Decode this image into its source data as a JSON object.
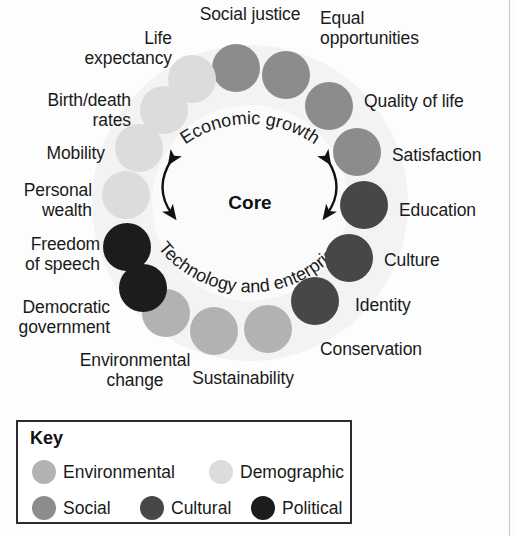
{
  "diagram": {
    "center_label": "Core",
    "arc_top": "Economic growth",
    "arc_bottom": "Technology and enterprise",
    "colors": {
      "Environmental": "#b2b2b2",
      "Demographic": "#dcdcdc",
      "Social": "#8c8c8c",
      "Cultural": "#474747",
      "Political": "#1c1c1c"
    },
    "nodes": [
      {
        "label": "Social justice",
        "category": "Social",
        "color": "#8c8c8c",
        "cx": 236,
        "cy": 68,
        "lx": 250,
        "ly": 14,
        "align": "c"
      },
      {
        "label": "Equal\nopportunities",
        "category": "Social",
        "color": "#8c8c8c",
        "cx": 286,
        "cy": 75,
        "lx": 320,
        "ly": 28,
        "align": "l"
      },
      {
        "label": "Quality of life",
        "category": "Social",
        "color": "#8c8c8c",
        "cx": 329,
        "cy": 106,
        "lx": 364,
        "ly": 101,
        "align": "l"
      },
      {
        "label": "Satisfaction",
        "category": "Social",
        "color": "#8c8c8c",
        "cx": 357,
        "cy": 152,
        "lx": 392,
        "ly": 155,
        "align": "l"
      },
      {
        "label": "Education",
        "category": "Cultural",
        "color": "#474747",
        "cx": 364,
        "cy": 205,
        "lx": 399,
        "ly": 210,
        "align": "l"
      },
      {
        "label": "Culture",
        "category": "Cultural",
        "color": "#474747",
        "cx": 349,
        "cy": 258,
        "lx": 384,
        "ly": 260,
        "align": "l"
      },
      {
        "label": "Identity",
        "category": "Cultural",
        "color": "#474747",
        "cx": 315,
        "cy": 301,
        "lx": 355,
        "ly": 305,
        "align": "l"
      },
      {
        "label": "Conservation",
        "category": "Environmental",
        "color": "#b2b2b2",
        "cx": 268,
        "cy": 329,
        "lx": 320,
        "ly": 349,
        "align": "l"
      },
      {
        "label": "Sustainability",
        "category": "Environmental",
        "color": "#b2b2b2",
        "cx": 214,
        "cy": 331,
        "lx": 243,
        "ly": 378,
        "align": "c"
      },
      {
        "label": "Environmental\nchange",
        "category": "Environmental",
        "color": "#b2b2b2",
        "cx": 166,
        "cy": 313,
        "lx": 135,
        "ly": 370,
        "align": "c"
      },
      {
        "label": "Democratic\ngovernment",
        "category": "Political",
        "color": "#1c1c1c",
        "cx": 143,
        "cy": 288,
        "lx": 110,
        "ly": 317,
        "align": "r"
      },
      {
        "label": "Freedom\nof speech",
        "category": "Political",
        "color": "#1c1c1c",
        "cx": 127,
        "cy": 247,
        "lx": 100,
        "ly": 254,
        "align": "r"
      },
      {
        "label": "Personal\nwealth",
        "category": "Demographic",
        "color": "#dcdcdc",
        "cx": 126,
        "cy": 195,
        "lx": 92,
        "ly": 200,
        "align": "r"
      },
      {
        "label": "Mobility",
        "category": "Demographic",
        "color": "#dcdcdc",
        "cx": 139,
        "cy": 148,
        "lx": 105,
        "ly": 153,
        "align": "r"
      },
      {
        "label": "Birth/death\nrates",
        "category": "Demographic",
        "color": "#dcdcdc",
        "cx": 164,
        "cy": 110,
        "lx": 131,
        "ly": 110,
        "align": "r"
      },
      {
        "label": "Life\nexpectancy",
        "category": "Demographic",
        "color": "#dcdcdc",
        "cx": 192,
        "cy": 79,
        "lx": 172,
        "ly": 48,
        "align": "r"
      }
    ]
  },
  "legend": {
    "title": "Key",
    "items": [
      {
        "label": "Environmental",
        "color": "#b2b2b2",
        "x": 14,
        "row": 1
      },
      {
        "label": "Demographic",
        "color": "#dcdcdc",
        "x": 191,
        "row": 1
      },
      {
        "label": "Social",
        "color": "#8c8c8c",
        "x": 14,
        "row": 2
      },
      {
        "label": "Cultural",
        "color": "#474747",
        "x": 122,
        "row": 2
      },
      {
        "label": "Political",
        "color": "#1c1c1c",
        "x": 233,
        "row": 2
      }
    ]
  }
}
